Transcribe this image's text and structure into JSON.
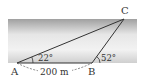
{
  "diagram": {
    "type": "triangle-river-surveying",
    "points": {
      "A": {
        "label": "A",
        "x": 17,
        "y": 63
      },
      "B": {
        "label": "B",
        "x": 92,
        "y": 63
      },
      "C": {
        "label": "C",
        "x": 124,
        "y": 19
      }
    },
    "angles": {
      "at_A": "22°",
      "at_B": "52°"
    },
    "distance_AB": "200 m",
    "colors": {
      "band_top": "#a9a9a9",
      "band_mid": "#ececec",
      "band_bottom": "#c9c9c9",
      "lines": "#333333"
    }
  }
}
